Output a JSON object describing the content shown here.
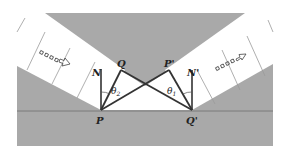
{
  "diagram": {
    "title": "",
    "colors": {
      "background": "#ffffff",
      "medium": "#a8a8a8",
      "band": "#ffffff",
      "line": "#333333",
      "boundary": "#7a7a7a"
    },
    "labels": {
      "P": "P",
      "Q": "Q",
      "N": "N",
      "P_prime": "P'",
      "Q_prime": "Q'",
      "N_prime": "N'",
      "theta2_main": "θ",
      "theta2_sub": "2",
      "theta1_main": "θ",
      "theta1_sub": "1"
    },
    "icons": {
      "incoming_arrow": "dotted-arrow-right-down",
      "outgoing_arrow": "dotted-arrow-right-up"
    }
  }
}
